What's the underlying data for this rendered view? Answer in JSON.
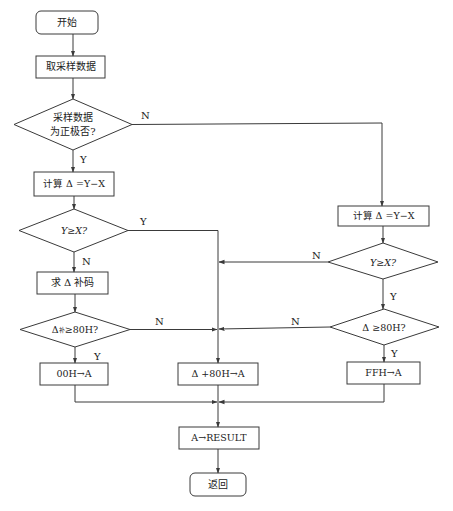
{
  "nodes": {
    "start": "开始",
    "get_data": "取采样数据",
    "check_sign_line1": "采样数据",
    "check_sign_line2": "为正极否?",
    "left_compute": "计算 Δ =Y−X",
    "left_compare": "Y≥X?",
    "complement": "求 Δ 补码",
    "left_threshold_prefix": "Δ",
    "left_threshold_sub": "补",
    "left_threshold_suffix": "≥80H?",
    "set_00h": "00H→A",
    "add_80h": "Δ +80H→A",
    "right_compute": "计算 Δ =Y−X",
    "right_compare": "Y≥X?",
    "right_threshold": "Δ ≥80H?",
    "set_ffh": "FFH→A",
    "store_result": "A→RESULT",
    "return": "返回"
  },
  "edge_labels": {
    "sign_no": "N",
    "sign_yes": "Y",
    "left_compare_yes": "Y",
    "left_compare_no": "N",
    "left_threshold_no": "N",
    "left_threshold_yes": "Y",
    "right_compare_no": "N",
    "right_compare_yes": "Y",
    "right_threshold_no": "N",
    "right_threshold_yes": "Y"
  },
  "colors": {
    "stroke": "#3a3a3a",
    "text": "#222222",
    "background": "#ffffff"
  }
}
